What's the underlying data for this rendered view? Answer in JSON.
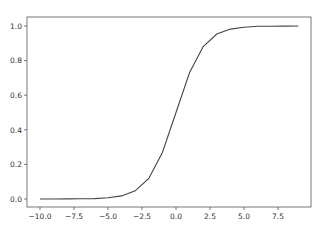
{
  "chart_data": {
    "type": "line",
    "title": "",
    "xlabel": "",
    "ylabel": "",
    "x": [
      -10,
      -9,
      -8,
      -7,
      -6,
      -5,
      -4,
      -3,
      -2,
      -1,
      0,
      1,
      2,
      3,
      4,
      5,
      6,
      7,
      8,
      9
    ],
    "series": [
      {
        "name": "sigmoid",
        "color": "#444444",
        "values": [
          4.54e-05,
          0.000123,
          0.000335,
          0.000911,
          0.00247,
          0.00669,
          0.018,
          0.0474,
          0.119,
          0.269,
          0.5,
          0.731,
          0.881,
          0.953,
          0.982,
          0.993,
          0.998,
          0.999,
          0.9997,
          0.9999
        ]
      }
    ],
    "xticks": [
      -10.0,
      -7.5,
      -5.0,
      -2.5,
      0.0,
      2.5,
      5.0,
      7.5
    ],
    "xtick_labels": [
      "−10.0",
      "−7.5",
      "−5.0",
      "−2.5",
      "0.0",
      "2.5",
      "5.0",
      "7.5"
    ],
    "yticks": [
      0.0,
      0.2,
      0.4,
      0.6,
      0.8,
      1.0
    ],
    "ytick_labels": [
      "0.0",
      "0.2",
      "0.4",
      "0.6",
      "0.8",
      "1.0"
    ],
    "xlim": [
      -10.95,
      9.95
    ],
    "ylim": [
      -0.05,
      1.05
    ],
    "grid": false,
    "legend": null
  }
}
